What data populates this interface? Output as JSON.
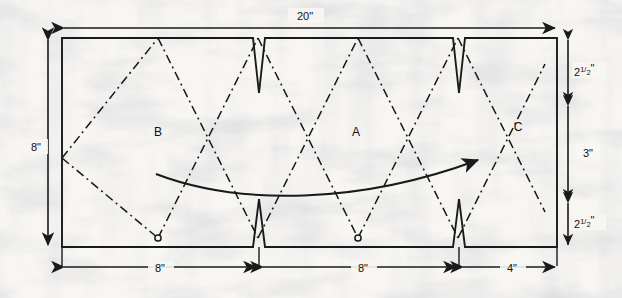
{
  "diagram": {
    "background_color": "#f7f6f3",
    "ink_color": "#1a1a1a",
    "sheet": {
      "outline_color": "#1a1a1a",
      "fill": "none"
    },
    "part_labels": [
      {
        "id": "label-b",
        "text": "B",
        "x": 158,
        "y": 136
      },
      {
        "id": "label-a",
        "text": "A",
        "x": 356,
        "y": 136
      },
      {
        "id": "label-c",
        "text": "C",
        "x": 518,
        "y": 131
      }
    ],
    "dimensions": {
      "top": [
        {
          "id": "dim-top-20",
          "text": "20\"",
          "x": 305,
          "y": 20
        }
      ],
      "left": [
        {
          "id": "dim-left-8",
          "text": "8\"",
          "x": 36,
          "y": 147
        }
      ],
      "right": [
        {
          "id": "dim-right-2p5-top",
          "whole": "2",
          "fraction_num": "1",
          "fraction_den": "2",
          "unit": "\"",
          "text": "2½\"",
          "x": 588,
          "y": 72
        },
        {
          "id": "dim-right-3",
          "text": "3\"",
          "x": 588,
          "y": 153
        },
        {
          "id": "dim-right-2p5-bottom",
          "whole": "2",
          "fraction_num": "1",
          "fraction_den": "2",
          "unit": "\"",
          "text": "2½\"",
          "x": 588,
          "y": 224
        }
      ],
      "bottom": [
        {
          "id": "dim-bottom-8-left",
          "text": "8\"",
          "x": 160,
          "y": 280
        },
        {
          "id": "dim-bottom-8-right",
          "text": "8\"",
          "x": 363,
          "y": 280
        },
        {
          "id": "dim-bottom-4",
          "text": "4\"",
          "x": 512,
          "y": 280
        }
      ]
    },
    "fold_lines": {
      "style": "dash-dot",
      "color": "#1a1a1a",
      "dash_pattern": "9 4 2 4"
    },
    "notches": {
      "count": 4,
      "shape": "narrow-v",
      "top_positions": [
        259,
        459
      ],
      "bottom_positions": [
        259,
        459
      ]
    },
    "pivot_markers": [
      {
        "id": "pivot-left",
        "x": 158,
        "y": 238
      },
      {
        "id": "pivot-right",
        "x": 358,
        "y": 238
      }
    ],
    "motion_arrow": {
      "id": "fold-motion-arrow",
      "description": "curved sweep arrow pointing up-right"
    }
  }
}
